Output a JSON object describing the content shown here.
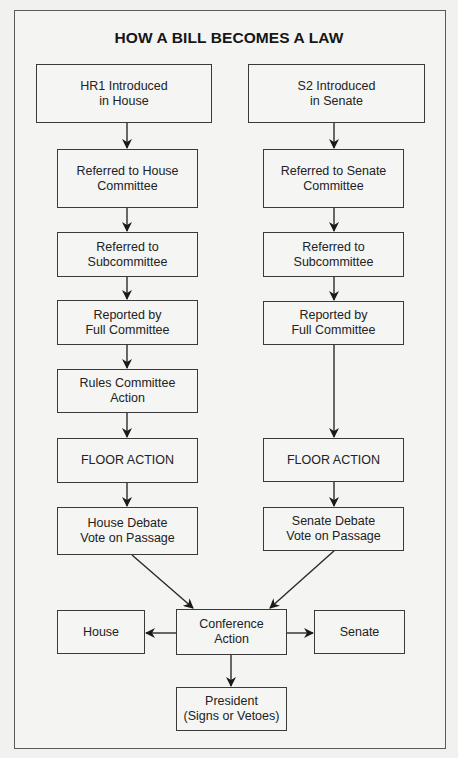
{
  "title": "HOW A BILL BECOMES A LAW",
  "colors": {
    "background": "#f1f1ef",
    "line": "#2a2a2a",
    "text": "#1e1e1e"
  },
  "house_column": {
    "steps": [
      {
        "label": "HR1 Introduced\nin House"
      },
      {
        "label": "Referred to House\nCommittee"
      },
      {
        "label": "Referred to\nSubcommittee"
      },
      {
        "label": "Reported by\nFull Committee"
      },
      {
        "label": "Rules Committee\nAction"
      },
      {
        "label": "FLOOR ACTION"
      },
      {
        "label": "House Debate\nVote on Passage"
      }
    ]
  },
  "senate_column": {
    "steps": [
      {
        "label": "S2 Introduced\nin Senate"
      },
      {
        "label": "Referred to Senate\nCommittee"
      },
      {
        "label": "Referred to\nSubcommittee"
      },
      {
        "label": "Reported by\nFull Committee"
      },
      {
        "label": "FLOOR ACTION"
      },
      {
        "label": "Senate Debate\nVote on Passage"
      }
    ]
  },
  "conference": {
    "center": {
      "label": "Conference\nAction"
    },
    "left": {
      "label": "House"
    },
    "right": {
      "label": "Senate"
    },
    "final": {
      "label": "President\n(Signs or Vetoes)"
    }
  }
}
